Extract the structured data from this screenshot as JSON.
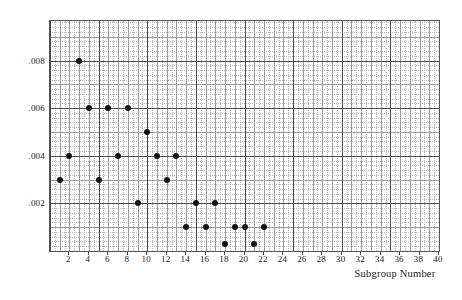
{
  "chart_data": {
    "type": "scatter",
    "title": "",
    "subtitle": "",
    "xlabel": "Subgroup Number",
    "ylabel": "",
    "xlim": [
      0,
      40
    ],
    "ylim": [
      0,
      0.00966
    ],
    "grid": true,
    "legend": null,
    "x_ticks": [
      2,
      4,
      6,
      8,
      10,
      12,
      14,
      16,
      18,
      20,
      22,
      24,
      26,
      28,
      30,
      32,
      34,
      36,
      38,
      40
    ],
    "x_tick_labels": [
      "2",
      "4",
      "6",
      "8",
      "10",
      "12",
      "14",
      "16",
      "18",
      "20",
      "22",
      "24",
      "26",
      "28",
      "30",
      "32",
      "34",
      "36",
      "38",
      "40"
    ],
    "y_ticks": [
      0.002,
      0.004,
      0.006,
      0.008
    ],
    "y_tick_labels": [
      ".002",
      ".004",
      ".006",
      ".008"
    ],
    "major_x_gridlines": [
      0,
      5,
      10,
      15,
      20,
      25,
      30,
      35,
      40
    ],
    "major_y_gridlines": [
      0.002,
      0.004,
      0.006,
      0.008
    ],
    "marker_color": "#111111",
    "grid_color": "#b9b9b9",
    "major_grid_color": "#4a4a4a",
    "x": [
      1,
      2,
      3,
      4,
      5,
      6,
      7,
      8,
      9,
      10,
      11,
      12,
      13,
      14,
      15,
      16,
      17,
      18,
      19,
      20,
      21,
      22
    ],
    "y": [
      0.003,
      0.004,
      0.008,
      0.006,
      0.003,
      0.006,
      0.004,
      0.006,
      0.002,
      0.005,
      0.004,
      0.003,
      0.004,
      0.001,
      0.002,
      0.001,
      0.002,
      0.0003,
      0.001,
      0.001,
      0.0003,
      0.001
    ],
    "points": [
      {
        "x": 1,
        "y": 0.003
      },
      {
        "x": 2,
        "y": 0.004
      },
      {
        "x": 3,
        "y": 0.008
      },
      {
        "x": 4,
        "y": 0.006
      },
      {
        "x": 5,
        "y": 0.003
      },
      {
        "x": 6,
        "y": 0.006
      },
      {
        "x": 7,
        "y": 0.004
      },
      {
        "x": 8,
        "y": 0.006
      },
      {
        "x": 9,
        "y": 0.002
      },
      {
        "x": 10,
        "y": 0.005
      },
      {
        "x": 11,
        "y": 0.004
      },
      {
        "x": 12,
        "y": 0.003
      },
      {
        "x": 13,
        "y": 0.004
      },
      {
        "x": 14,
        "y": 0.001
      },
      {
        "x": 15,
        "y": 0.002
      },
      {
        "x": 16,
        "y": 0.001
      },
      {
        "x": 17,
        "y": 0.002
      },
      {
        "x": 18,
        "y": 0.0003
      },
      {
        "x": 19,
        "y": 0.001
      },
      {
        "x": 20,
        "y": 0.001
      },
      {
        "x": 21,
        "y": 0.0003
      },
      {
        "x": 22,
        "y": 0.001
      }
    ]
  }
}
